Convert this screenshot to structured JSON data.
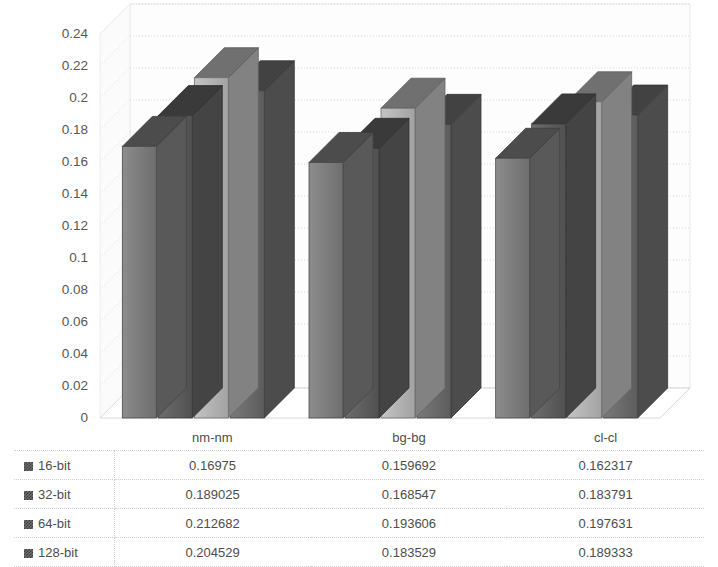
{
  "chart_data": {
    "type": "bar",
    "title": "",
    "xlabel": "",
    "ylabel": "",
    "categories": [
      "nm-nm",
      "bg-bg",
      "cl-cl"
    ],
    "series": [
      {
        "name": "16-bit",
        "values": [
          0.16975,
          0.159692,
          0.162317
        ],
        "color": "#7b7b7b"
      },
      {
        "name": "32-bit",
        "values": [
          0.189025,
          0.168547,
          0.183791
        ],
        "color": "#5e5e5e"
      },
      {
        "name": "64-bit",
        "values": [
          0.212682,
          0.193606,
          0.197631
        ],
        "color": "#b4b4b4"
      },
      {
        "name": "128-bit",
        "values": [
          0.204529,
          0.183529,
          0.189333
        ],
        "color": "#6a6a6a"
      }
    ],
    "ylim": [
      0,
      0.24
    ],
    "ytick_step": 0.02,
    "yticks": [
      "0.24",
      "0.22",
      "0.2",
      "0.18",
      "0.16",
      "0.14",
      "0.12",
      "0.1",
      "0.08",
      "0.06",
      "0.04",
      "0.02",
      "0"
    ],
    "grid": true,
    "three_d": true,
    "legend_position": "data-table",
    "background_color": "#ffffff"
  },
  "table": {
    "corner_label": "",
    "column_headers": [
      "nm-nm",
      "bg-bg",
      "cl-cl"
    ],
    "rows": [
      {
        "series": "16-bit",
        "values": [
          "0.16975",
          "0.159692",
          "0.162317"
        ]
      },
      {
        "series": "32-bit",
        "values": [
          "0.189025",
          "0.168547",
          "0.183791"
        ]
      },
      {
        "series": "64-bit",
        "values": [
          "0.212682",
          "0.193606",
          "0.197631"
        ]
      },
      {
        "series": "128-bit",
        "values": [
          "0.204529",
          "0.183529",
          "0.189333"
        ]
      }
    ]
  }
}
